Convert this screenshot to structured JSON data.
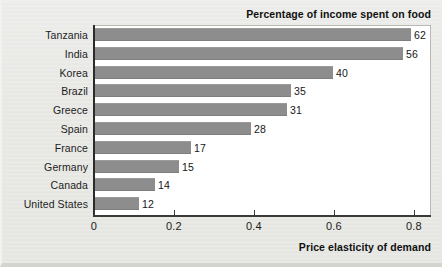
{
  "chart_data": {
    "type": "bar",
    "orientation": "horizontal",
    "title": "Percentage of income spent on food",
    "xlabel": "Price elasticity of demand",
    "ylabel": "",
    "grid": false,
    "legend": null,
    "xlim": [
      0,
      0.8425
    ],
    "xticks": [
      0,
      0.2,
      0.4,
      0.6,
      0.8
    ],
    "xtick_labels": [
      "0",
      "0.2",
      "0.4",
      "0.6",
      "0.8"
    ],
    "categories": [
      "Tanzania",
      "India",
      "Korea",
      "Brazil",
      "Greece",
      "Spain",
      "France",
      "Germany",
      "Canada",
      "United States"
    ],
    "values": [
      0.79,
      0.77,
      0.595,
      0.49,
      0.48,
      0.39,
      0.24,
      0.21,
      0.15,
      0.11
    ],
    "data_labels": [
      "62",
      "56",
      "40",
      "35",
      "31",
      "28",
      "17",
      "15",
      "14",
      "12"
    ],
    "bars": [
      {
        "category": "Tanzania",
        "elasticity": 0.79,
        "percent_income_food": 62
      },
      {
        "category": "India",
        "elasticity": 0.77,
        "percent_income_food": 56
      },
      {
        "category": "Korea",
        "elasticity": 0.595,
        "percent_income_food": 40
      },
      {
        "category": "Brazil",
        "elasticity": 0.49,
        "percent_income_food": 35
      },
      {
        "category": "Greece",
        "elasticity": 0.48,
        "percent_income_food": 31
      },
      {
        "category": "Spain",
        "elasticity": 0.39,
        "percent_income_food": 28
      },
      {
        "category": "France",
        "elasticity": 0.24,
        "percent_income_food": 17
      },
      {
        "category": "Germany",
        "elasticity": 0.21,
        "percent_income_food": 15
      },
      {
        "category": "Canada",
        "elasticity": 0.15,
        "percent_income_food": 14
      },
      {
        "category": "United States",
        "elasticity": 0.11,
        "percent_income_food": 12
      }
    ],
    "colors": {
      "bar": "#8d8d8d",
      "axis": "#2b2b2b",
      "panel_background": "#ffffff",
      "figure_background": "#e8e8e5",
      "text": "#1c1c1c"
    }
  }
}
